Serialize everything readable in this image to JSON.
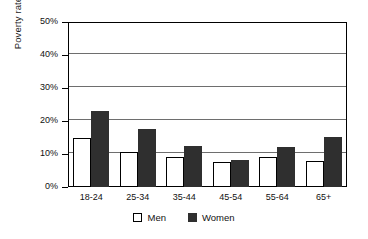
{
  "chart_data": {
    "type": "bar",
    "title": "",
    "subtitle": "",
    "xlabel": "",
    "ylabel": "Poverty rate",
    "categories": [
      "18-24",
      "25-34",
      "35-44",
      "45-54",
      "55-64",
      "65+"
    ],
    "series": [
      {
        "name": "Men",
        "color": "#ffffff",
        "values": [
          15.0,
          10.5,
          9.0,
          7.5,
          9.0,
          8.0
        ]
      },
      {
        "name": "Women",
        "color": "#2f2f2f",
        "values": [
          23.0,
          17.5,
          12.5,
          8.3,
          12.0,
          15.3
        ]
      }
    ],
    "ylim": [
      0,
      50
    ],
    "ytick_step": 10,
    "ytick_labels": [
      "0%",
      "10%",
      "20%",
      "30%",
      "40%",
      "50%"
    ],
    "ytick_values": [
      0,
      10,
      20,
      30,
      40,
      50
    ],
    "grid": true,
    "grid_axis": "y",
    "legend_position": "bottom",
    "legend_entries": [
      "Men",
      "Women"
    ],
    "annotations": []
  },
  "axis": {
    "y_title": "Poverty rate"
  },
  "legend": {
    "men_label": "Men",
    "women_label": "Women"
  }
}
